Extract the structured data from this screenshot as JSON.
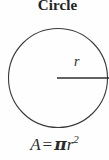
{
  "figure": {
    "title": "Circle",
    "shape_name": "circle",
    "radius_label": "r",
    "formula": {
      "full_text": "A = πr²",
      "area_symbol": "A",
      "equals": "=",
      "pi_symbol": "π",
      "radius_symbol": "r",
      "exponent": "2"
    },
    "geometry": {
      "center_x": 58,
      "center_y": 78,
      "radius_px": 50,
      "radius_line_from_x": 57,
      "radius_line_to_x": 109,
      "radius_line_y": 78
    },
    "colors": {
      "stroke": "#3a3a3a",
      "text": "#2b2b2b",
      "title": "#232323",
      "background": "#fefefe"
    }
  }
}
